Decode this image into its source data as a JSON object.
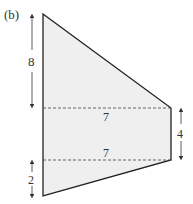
{
  "figure": {
    "label": "(b)",
    "shape": "trapezoid-like quadrilateral split by two horizontal dashed lines",
    "fill_color": "#efefef",
    "stroke_color": "#222222"
  },
  "dimensions": {
    "left_top_height": "8",
    "upper_dashed_width": "7",
    "lower_dashed_width": "7",
    "right_height": "4",
    "left_bottom_height": "2"
  }
}
